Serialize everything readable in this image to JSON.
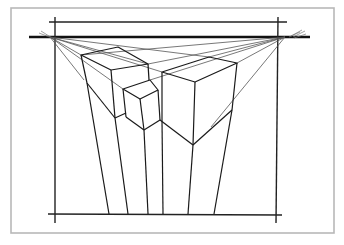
{
  "figure": {
    "colors": {
      "background": "#ffffff",
      "frame": "#b8b8b8",
      "ink": "#1a1a1a"
    },
    "elements": [
      {
        "name": "horizon-line",
        "from": [
          30,
          37
        ],
        "to": [
          304,
          37
        ]
      },
      {
        "name": "left-vanishing-point",
        "at": [
          50,
          37
        ]
      },
      {
        "name": "right-vanishing-point",
        "at": [
          285,
          37
        ]
      },
      {
        "name": "left-cube"
      },
      {
        "name": "small-cube"
      },
      {
        "name": "right-cube"
      },
      {
        "name": "ground-line",
        "y": 214
      }
    ]
  }
}
